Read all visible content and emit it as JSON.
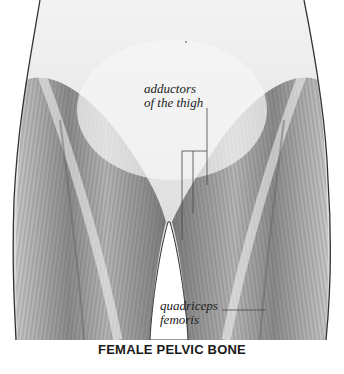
{
  "figure": {
    "colors": {
      "background": "#ffffff",
      "muscle_dark": "#555555",
      "muscle_mid": "#9a9a9a",
      "muscle_light": "#d6d6d6",
      "skin": "#e8e8e8",
      "outline": "#333333",
      "leader": "#444444"
    }
  },
  "labels": {
    "adductors": {
      "line1": "adductors",
      "line2": "of the thigh"
    },
    "quadriceps": {
      "line1": "quadriceps",
      "line2": "femoris"
    }
  },
  "caption": "FEMALE PELVIC BONE"
}
